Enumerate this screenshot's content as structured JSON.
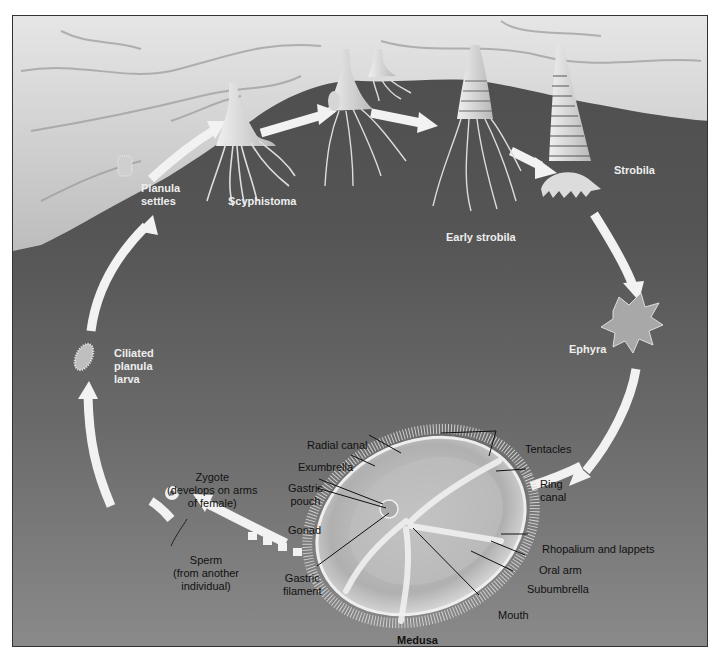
{
  "diagram": {
    "colors": {
      "background_top": "#4d4d4d",
      "background_bottom": "#8a8a8a",
      "rock": "#d8d8d8",
      "arrow": "#f2f2f2",
      "stage_label": "#eeeeee",
      "anatomy_label": "#111111"
    },
    "stages": [
      {
        "id": "planula-settles",
        "line1": "Planula",
        "line2": "settles"
      },
      {
        "id": "scyphistoma",
        "line1": "Scyphistoma"
      },
      {
        "id": "early-strobila",
        "line1": "Early strobila"
      },
      {
        "id": "strobila",
        "line1": "Strobila"
      },
      {
        "id": "ephyra",
        "line1": "Ephyra"
      },
      {
        "id": "medusa",
        "line1": "Medusa"
      },
      {
        "id": "zygote",
        "line1": "Zygote",
        "line2": "(develops on arms",
        "line3": "of female)"
      },
      {
        "id": "sperm",
        "line1": "Sperm",
        "line2": "(from another",
        "line3": "individual)"
      },
      {
        "id": "ciliated-planula-larva",
        "line1": "Ciliated",
        "line2": "planula",
        "line3": "larva"
      }
    ],
    "medusa_parts": {
      "radial_canal": "Radial canal",
      "exumbrella": "Exumbrella",
      "gastric_pouch_1": "Gastric",
      "gastric_pouch_2": "pouch",
      "gonad": "Gonad",
      "gastric_filament_1": "Gastric",
      "gastric_filament_2": "filament",
      "tentacles": "Tentacles",
      "ring_canal_1": "Ring",
      "ring_canal_2": "canal",
      "rhopalium": "Rhopalium and lappets",
      "oral_arm": "Oral arm",
      "subumbrella": "Subumbrella",
      "mouth": "Mouth"
    }
  }
}
